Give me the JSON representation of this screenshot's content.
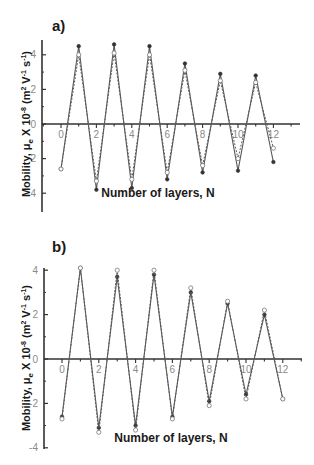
{
  "chart_data": [
    {
      "panel": "a)",
      "type": "line",
      "xlabel": "Number of layers, N",
      "ylabel": "Mobility, μe X 10-8 (m2 V-1 s-1)",
      "ylabel_parts": {
        "main": "Mobility, μ",
        "sub": "e",
        "mid": " X 10",
        "sup1": "-8",
        "unit": " (m",
        "sup2": "2",
        "unit2": " V",
        "sup3": "-1",
        "unit3": " s",
        "sup4": "-1",
        "end": ")"
      },
      "x_ticks": [
        0,
        2,
        4,
        6,
        8,
        10,
        12
      ],
      "y_ticks": [
        4,
        2,
        0,
        -2,
        -4
      ],
      "y_tick_labels": [
        "4",
        "2",
        "0",
        "2",
        "4"
      ],
      "xlim": [
        -1.0,
        13.0
      ],
      "ylim": [
        -5,
        5
      ],
      "grid": false,
      "x": [
        0,
        1,
        2,
        3,
        4,
        5,
        6,
        7,
        8,
        9,
        10,
        11,
        12
      ],
      "series": [
        {
          "name": "solid",
          "style": "solid",
          "marker": "filled",
          "values": [
            -2.6,
            4.5,
            -3.8,
            4.6,
            -3.7,
            4.5,
            -3.2,
            3.5,
            -2.8,
            2.9,
            -2.7,
            2.8,
            -2.2
          ]
        },
        {
          "name": "dashed",
          "style": "dashed",
          "marker": "open",
          "values": [
            -2.6,
            4.0,
            -3.3,
            4.1,
            -3.2,
            4.0,
            -2.8,
            3.1,
            -2.4,
            2.5,
            -2.0,
            2.4,
            -1.4
          ]
        }
      ]
    },
    {
      "panel": "b)",
      "type": "line",
      "xlabel": "Number of layers, N",
      "ylabel": "Mobility, μe X 10-8 (m2 V-1 s-1)",
      "ylabel_parts": {
        "main": "Mobility, μ",
        "sub": "e",
        "mid": " X 10",
        "sup1": "-8",
        "unit": " (m",
        "sup2": "2",
        "unit2": " V",
        "sup3": "-1",
        "unit3": " s",
        "sup4": "-1",
        "end": ")"
      },
      "x_ticks": [
        0,
        2,
        4,
        6,
        8,
        10,
        12
      ],
      "y_ticks": [
        4,
        2,
        0,
        -2,
        -4
      ],
      "y_tick_labels": [
        "4",
        "2",
        "0",
        "-2",
        "-4"
      ],
      "xlim": [
        -1.0,
        13.0
      ],
      "ylim": [
        -4.2,
        4.2
      ],
      "grid": false,
      "x": [
        0,
        1,
        2,
        3,
        4,
        5,
        6,
        7,
        8,
        9,
        10,
        11,
        12
      ],
      "series": [
        {
          "name": "solid",
          "style": "solid",
          "marker": "filled",
          "values": [
            -2.6,
            4.1,
            -3.1,
            3.7,
            -3.0,
            3.8,
            -2.6,
            3.0,
            -1.9,
            2.5,
            -1.6,
            2.0,
            -1.8
          ]
        },
        {
          "name": "dashed",
          "style": "dashed",
          "marker": "open",
          "values": [
            -2.7,
            4.1,
            -3.3,
            4.0,
            -3.2,
            4.0,
            -2.7,
            3.2,
            -2.1,
            2.6,
            -1.8,
            2.2,
            -1.8
          ]
        }
      ]
    }
  ],
  "caption_fragment": "",
  "colors": {
    "line": "#5a5a5a",
    "axis": "#333333",
    "tick_label": "#8a8a8a",
    "title": "#1a1a1a"
  }
}
